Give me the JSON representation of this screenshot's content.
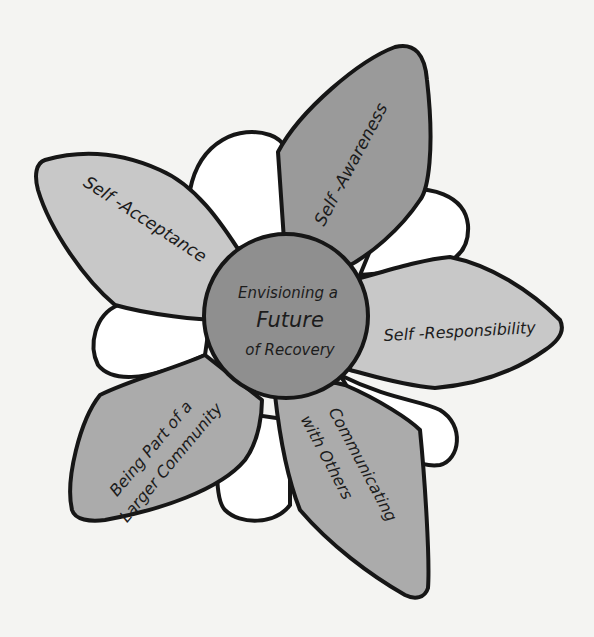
{
  "diagram": {
    "type": "flower-diagram",
    "center": {
      "line1": "Envisioning a",
      "line2": "Future",
      "line3": "of Recovery"
    },
    "petals": [
      {
        "id": "self-awareness",
        "label": "Self -Awareness"
      },
      {
        "id": "self-acceptance",
        "label": "Self -Acceptance"
      },
      {
        "id": "self-responsibility",
        "label": "Self -Responsibility"
      },
      {
        "id": "being-part-of-community",
        "line1": "Being Part of a",
        "line2": "Larger Community"
      },
      {
        "id": "communicating-with-others",
        "line1": "Communicating",
        "line2": "with Others"
      }
    ],
    "colors": {
      "background": "#f4f4f2",
      "center_fill": "#8f8f8f",
      "dark_petal": "#9a9a9a",
      "medium_petal": "#ababab",
      "light_petal": "#c8c8c8",
      "back_petal": "#ffffff",
      "outline": "#161616"
    }
  }
}
